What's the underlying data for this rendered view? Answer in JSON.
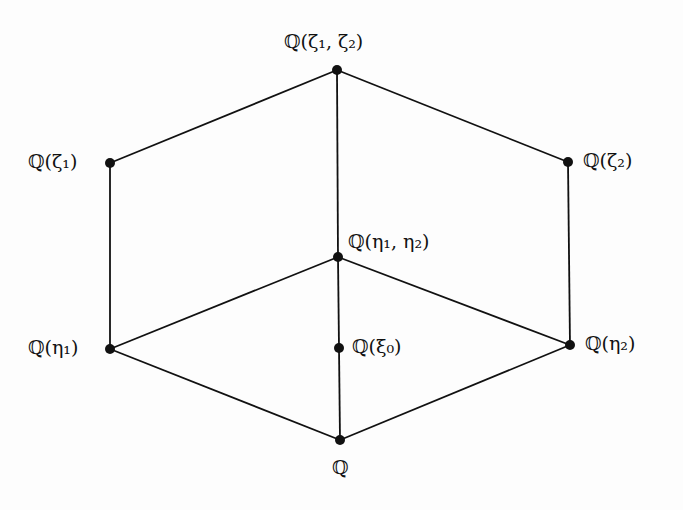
{
  "diagram": {
    "type": "lattice",
    "nodes": [
      {
        "id": "top",
        "label": "ℚ(ζ₁, ζ₂)",
        "x": 337,
        "y": 70,
        "lx": 284,
        "ly": 32,
        "anchor": "above"
      },
      {
        "id": "zeta1",
        "label": "ℚ(ζ₁)",
        "x": 110,
        "y": 163,
        "lx": 28,
        "ly": 152,
        "anchor": "left"
      },
      {
        "id": "zeta2",
        "label": "ℚ(ζ₂)",
        "x": 568,
        "y": 162,
        "lx": 583,
        "ly": 151,
        "anchor": "right"
      },
      {
        "id": "eta12",
        "label": "ℚ(η₁, η₂)",
        "x": 338,
        "y": 257,
        "lx": 348,
        "ly": 232,
        "anchor": "right"
      },
      {
        "id": "eta1",
        "label": "ℚ(η₁)",
        "x": 110,
        "y": 349,
        "lx": 28,
        "ly": 338,
        "anchor": "left"
      },
      {
        "id": "xi0",
        "label": "ℚ(ξ₀)",
        "x": 339,
        "y": 348,
        "lx": 352,
        "ly": 337,
        "anchor": "right"
      },
      {
        "id": "eta2",
        "label": "ℚ(η₂)",
        "x": 570,
        "y": 345,
        "lx": 585,
        "ly": 334,
        "anchor": "right"
      },
      {
        "id": "Q",
        "label": "ℚ",
        "x": 340,
        "y": 440,
        "lx": 332,
        "ly": 458,
        "anchor": "below"
      }
    ],
    "edges": [
      [
        "top",
        "zeta1"
      ],
      [
        "top",
        "zeta2"
      ],
      [
        "top",
        "eta12"
      ],
      [
        "zeta1",
        "eta1"
      ],
      [
        "zeta2",
        "eta2"
      ],
      [
        "eta12",
        "eta1"
      ],
      [
        "eta12",
        "eta2"
      ],
      [
        "eta12",
        "xi0"
      ],
      [
        "xi0",
        "Q"
      ],
      [
        "eta1",
        "Q"
      ],
      [
        "eta2",
        "Q"
      ]
    ]
  }
}
